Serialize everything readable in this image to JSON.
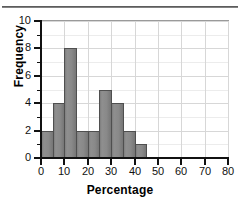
{
  "chart_data": {
    "type": "bar",
    "title": "",
    "subtitle": "",
    "xlabel": "Percentage",
    "ylabel": "Frequency",
    "bin_width": 5,
    "bin_edges": [
      0,
      5,
      10,
      15,
      20,
      25,
      30,
      35,
      40,
      45
    ],
    "categories": [
      "0-5",
      "5-10",
      "10-15",
      "15-20",
      "20-25",
      "25-30",
      "30-35",
      "35-40",
      "40-45"
    ],
    "values": [
      2,
      4,
      8,
      2,
      2,
      5,
      4,
      2,
      1
    ],
    "xlim": [
      0,
      80
    ],
    "ylim": [
      0,
      10
    ],
    "xticks": [
      0,
      10,
      20,
      30,
      40,
      50,
      60,
      70,
      80
    ],
    "yticks": [
      0,
      2,
      4,
      6,
      8,
      10
    ],
    "y_minor_ticks": [
      1,
      3,
      5,
      7,
      9
    ],
    "grid": true,
    "legend": false,
    "bar_color": "#8a8a8a",
    "bar_edge_color": "#4f4f4f",
    "axis_color": "#111111",
    "grid_color": "#d7d7d7"
  },
  "axes": {
    "x_tick_labels": [
      "0",
      "10",
      "20",
      "30",
      "40",
      "50",
      "60",
      "70",
      "80"
    ],
    "y_tick_labels": [
      "0",
      "2",
      "4",
      "6",
      "8",
      "10"
    ],
    "x_title": "Percentage",
    "y_title": "Frequency"
  }
}
